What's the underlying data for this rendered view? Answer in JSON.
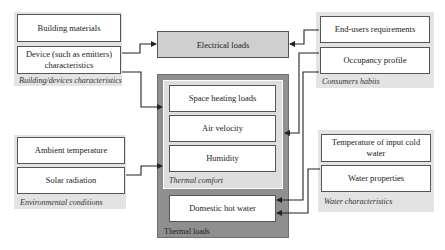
{
  "diagram": {
    "groups": {
      "building": {
        "caption": "Building/devices characteristics",
        "items": [
          "Building materials",
          "Device (such as emitters) characteristics"
        ]
      },
      "environment": {
        "caption": "Environmental conditions",
        "items": [
          "Ambient temperature",
          "Solar radiation"
        ]
      },
      "consumers": {
        "caption": "Consumers habits",
        "items": [
          "End-users requirements",
          "Occupancy profile"
        ]
      },
      "water": {
        "caption": "Water characteristics",
        "items": [
          "Temperature of input cold water",
          "Water properties"
        ]
      }
    },
    "electrical_loads": "Electrical loads",
    "thermal_loads": {
      "caption": "Thermal loads",
      "thermal_comfort": {
        "caption": "Thermal comfort",
        "items": [
          "Space heating loads",
          "Air velocity",
          "Humidity"
        ]
      },
      "domestic_hot_water": "Domestic hot water"
    },
    "colors": {
      "group_background": "#e3e3e3",
      "electrical_box": "#cfcfcf",
      "thermal_outer": "#8f8f8f",
      "thermal_inner": "#dedede",
      "line": "#222222"
    }
  }
}
